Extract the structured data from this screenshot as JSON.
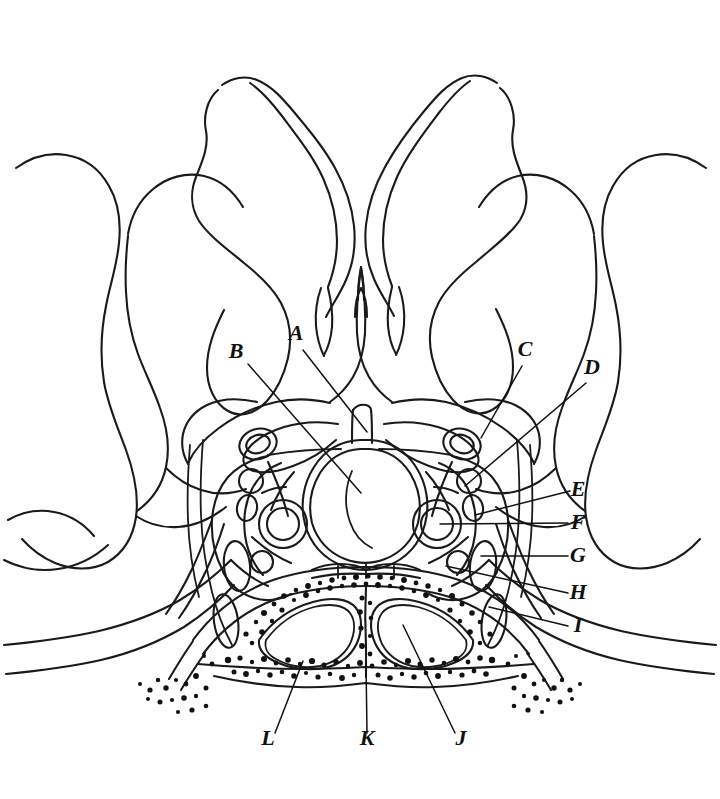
{
  "figure": {
    "type": "anatomical-line-drawing",
    "background_color": "#ffffff",
    "line_color": "#1a1a1a",
    "width": 720,
    "height": 799
  },
  "labels": [
    {
      "id": "A",
      "text": "A",
      "x": 296,
      "y": 340,
      "leader_from": [
        303,
        350
      ],
      "leader_to": [
        367,
        432
      ],
      "target": "midline-structure-above-sella"
    },
    {
      "id": "B",
      "text": "B",
      "x": 236,
      "y": 358,
      "leader_from": [
        248,
        364
      ],
      "leader_to": [
        361,
        493
      ],
      "target": "pituitary-gland"
    },
    {
      "id": "C",
      "text": "C",
      "x": 525,
      "y": 356,
      "leader_from": [
        522,
        366
      ],
      "leader_to": [
        481,
        438
      ],
      "target": "upper-right-ring-structure"
    },
    {
      "id": "D",
      "text": "D",
      "x": 592,
      "y": 374,
      "leader_from": [
        586,
        383
      ],
      "leader_to": [
        465,
        486
      ],
      "target": "right-lateral-wall"
    },
    {
      "id": "E",
      "text": "E",
      "x": 578,
      "y": 496,
      "leader_from": [
        570,
        491
      ],
      "leader_to": [
        475,
        515
      ],
      "target": "small-right-oval"
    },
    {
      "id": "F",
      "text": "F",
      "x": 578,
      "y": 529,
      "leader_from": [
        568,
        523
      ],
      "leader_to": [
        440,
        524
      ],
      "target": "right-carotid-artery"
    },
    {
      "id": "G",
      "text": "G",
      "x": 578,
      "y": 562,
      "leader_from": [
        568,
        556
      ],
      "leader_to": [
        481,
        556
      ],
      "target": "right-lateral-compartment"
    },
    {
      "id": "H",
      "text": "H",
      "x": 578,
      "y": 599,
      "leader_from": [
        568,
        593
      ],
      "leader_to": [
        446,
        566
      ],
      "target": "lower-right-nerve"
    },
    {
      "id": "I",
      "text": "I",
      "x": 578,
      "y": 632,
      "leader_from": [
        568,
        626
      ],
      "leader_to": [
        489,
        607
      ],
      "target": "outer-right-oval"
    },
    {
      "id": "J",
      "text": "J",
      "x": 461,
      "y": 745,
      "leader_from": [
        455,
        733
      ],
      "leader_to": [
        403,
        625
      ],
      "target": "right-sphenoid-sinus-cell"
    },
    {
      "id": "K",
      "text": "K",
      "x": 367,
      "y": 745,
      "leader_from": [
        367,
        733
      ],
      "leader_to": [
        366,
        663
      ],
      "target": "intersinus-septum"
    },
    {
      "id": "L",
      "text": "L",
      "x": 268,
      "y": 745,
      "leader_from": [
        275,
        733
      ],
      "leader_to": [
        303,
        661
      ],
      "target": "sphenoid-bone-floor"
    }
  ],
  "structures": {
    "center": "pituitary-gland-with-infundibular-stalk",
    "lower": "sphenoid-sinus-two-air-cells-with-septum",
    "lateral": "cavernous-sinus-left-and-right",
    "upper": "brain-and-temporal-lobe-outlines",
    "shading": "stippled-cancellous-bone"
  }
}
